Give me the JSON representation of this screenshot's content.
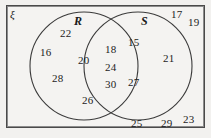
{
  "figure": {
    "type": "venn-diagram",
    "universal_set_symbol": "ξ",
    "background_color": "#f2f1ef",
    "border_color": "#4a4a4a",
    "stroke_color": "#3b3b3b",
    "text_color": "#1c1c1c"
  },
  "sets": {
    "left": {
      "label": "R",
      "cx": 84,
      "cy": 66,
      "r": 54
    },
    "right": {
      "label": "S",
      "cx": 138,
      "cy": 66,
      "r": 54
    }
  },
  "regions": {
    "left_only": {
      "name": "R only",
      "values": [
        16,
        22,
        20,
        28,
        26
      ]
    },
    "intersection": {
      "name": "R and S",
      "values": [
        18,
        24,
        30
      ]
    },
    "right_only": {
      "name": "S only",
      "values": [
        15,
        21,
        27
      ]
    },
    "outside": {
      "name": "outside both",
      "values": [
        17,
        19,
        23,
        25,
        29
      ]
    }
  },
  "elements": [
    {
      "value": "22",
      "x": 60,
      "y": 28,
      "region": "left_only"
    },
    {
      "value": "16",
      "x": 40,
      "y": 47,
      "region": "left_only"
    },
    {
      "value": "20",
      "x": 78,
      "y": 55,
      "region": "left_only"
    },
    {
      "value": "28",
      "x": 52,
      "y": 73,
      "region": "left_only"
    },
    {
      "value": "26",
      "x": 82,
      "y": 95,
      "region": "left_only"
    },
    {
      "value": "18",
      "x": 105,
      "y": 44,
      "region": "intersection"
    },
    {
      "value": "24",
      "x": 105,
      "y": 62,
      "region": "intersection"
    },
    {
      "value": "30",
      "x": 105,
      "y": 79,
      "region": "intersection"
    },
    {
      "value": "15",
      "x": 128,
      "y": 37,
      "region": "right_only"
    },
    {
      "value": "27",
      "x": 128,
      "y": 77,
      "region": "right_only"
    },
    {
      "value": "21",
      "x": 163,
      "y": 53,
      "region": "right_only"
    },
    {
      "value": "17",
      "x": 171,
      "y": 9,
      "region": "outside"
    },
    {
      "value": "19",
      "x": 188,
      "y": 17,
      "region": "outside"
    },
    {
      "value": "23",
      "x": 183,
      "y": 114,
      "region": "outside"
    },
    {
      "value": "25",
      "x": 131,
      "y": 118,
      "region": "outside"
    },
    {
      "value": "29",
      "x": 161,
      "y": 118,
      "region": "outside"
    }
  ],
  "labels": {
    "xi": {
      "text": "ξ",
      "x": 10,
      "y": 9
    },
    "R": {
      "text": "R",
      "x": 74,
      "y": 15
    },
    "S": {
      "text": "S",
      "x": 141,
      "y": 15
    }
  }
}
